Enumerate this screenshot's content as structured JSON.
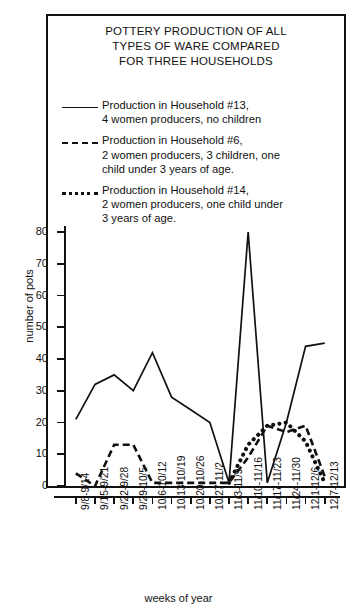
{
  "title": "POTTERY PRODUCTION OF ALL TYPES OF WARE COMPARED FOR THREE HOUSEHOLDS",
  "title_lines": [
    "POTTERY PRODUCTION OF ALL",
    "TYPES OF WARE COMPARED",
    "FOR THREE HOUSEHOLDS"
  ],
  "legend": {
    "position": "inside-top",
    "entries": [
      {
        "key": "solid",
        "name": "Production in Household #13",
        "lines": [
          "Production in Household #13,",
          "4 women producers, no children"
        ]
      },
      {
        "key": "dashed",
        "name": "Production in Household #6",
        "lines": [
          "Production in Household #6,",
          "2 women producers, 3 children, one",
          "child under 3 years of age."
        ]
      },
      {
        "key": "dotted",
        "name": "Production in Household #14",
        "lines": [
          "Production in Household #14,",
          "2 women producers, one child under",
          "3 years of age."
        ]
      }
    ]
  },
  "axes": {
    "ylabel": "number of pots",
    "xlabel": "weeks of year",
    "yticks": [
      0,
      10,
      20,
      30,
      40,
      50,
      60,
      70,
      80
    ],
    "ylim": [
      0,
      80
    ]
  },
  "chart_data": {
    "type": "line",
    "title": "POTTERY PRODUCTION OF ALL TYPES OF WARE COMPARED FOR THREE HOUSEHOLDS",
    "xlabel": "weeks of year",
    "ylabel": "number of pots",
    "ylim": [
      0,
      80
    ],
    "grid": false,
    "legend_position": "inside-top",
    "categories": [
      "9/8-9/14",
      "9/15-9/21",
      "9/22-9/28",
      "9/29-10/5",
      "10/6-10/12",
      "10/13-10/19",
      "10/20-10/26",
      "10/27-11/2",
      "11/3-11/9",
      "11/10-11/16",
      "11/17-11/23",
      "11/24-11/30",
      "12/1-12/6",
      "12/7-12/13"
    ],
    "series": [
      {
        "name": "Production in Household #13, 4 women producers, no children",
        "style": "solid",
        "values": [
          21,
          32,
          35,
          30,
          42,
          28,
          24,
          20,
          1,
          80,
          1,
          20,
          44,
          45
        ]
      },
      {
        "name": "Production in Household #6, 2 women producers, 3 children, one child under 3 years of age.",
        "style": "dashed",
        "values": [
          4,
          0,
          13,
          13,
          1,
          1,
          1,
          1,
          1,
          9,
          19,
          17,
          19,
          3
        ]
      },
      {
        "name": "Production in Household #14, 2 women producers, one child under 3 years of age.",
        "style": "dotted",
        "values": [
          null,
          null,
          null,
          null,
          null,
          null,
          null,
          null,
          1,
          13,
          19,
          20,
          14,
          1
        ]
      }
    ]
  }
}
